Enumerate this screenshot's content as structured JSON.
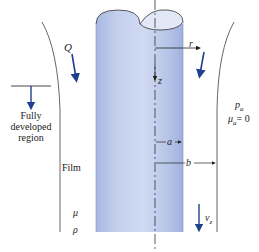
{
  "diagram": {
    "labels": {
      "flow_rate": "Q",
      "radial_coord": "r",
      "axial_coord": "z",
      "fully_developed": [
        "Fully",
        "developed",
        "region"
      ],
      "film": "Film",
      "viscosity": "μ",
      "density": "ρ",
      "inner_radius": "a",
      "outer_radius": "b",
      "ambient_pressure": "p",
      "ambient_pressure_sub": "a",
      "ambient_viscosity": "μ",
      "ambient_viscosity_sub": "a",
      "ambient_viscosity_value": "= 0",
      "velocity": "v",
      "velocity_sub": "z"
    },
    "colors": {
      "cylinder_light": "#d4dcf0",
      "cylinder_mid": "#b8c6e8",
      "cylinder_dark": "#9aaed8",
      "arrow_blue": "#1f3f8f",
      "line": "#333333"
    }
  }
}
